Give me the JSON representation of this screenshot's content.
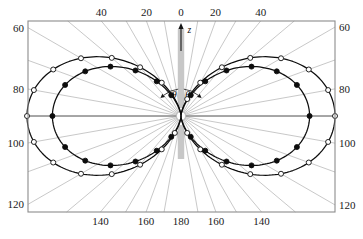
{
  "figure": {
    "kind": "polar-angular-distribution",
    "frame": {
      "left": 28,
      "top": 21,
      "right": 335,
      "bottom": 212
    },
    "center": {
      "x": 181,
      "y": 116
    },
    "axis_marker_label": "z",
    "angle_symbol": "θ",
    "frame_color": "#8c8c8c",
    "grid_color": "#9a9a9a",
    "curve_color": "#0d0d0d",
    "holder_color": "#bdbdbd"
  },
  "axes": {
    "top_labels": [
      {
        "text": "40",
        "angle_deg": -40
      },
      {
        "text": "20",
        "angle_deg": -20
      },
      {
        "text": "0",
        "angle_deg": 0
      },
      {
        "text": "20",
        "angle_deg": 20
      },
      {
        "text": "40",
        "angle_deg": 40
      }
    ],
    "bottom_labels": [
      {
        "text": "140",
        "angle_deg": -140
      },
      {
        "text": "160",
        "angle_deg": -160
      },
      {
        "text": "180",
        "angle_deg": 180
      },
      {
        "text": "160",
        "angle_deg": 160
      },
      {
        "text": "140",
        "angle_deg": 140
      }
    ],
    "left_labels": [
      {
        "text": "60",
        "angle_deg": -60
      },
      {
        "text": "80",
        "angle_deg": -80
      },
      {
        "text": "100",
        "angle_deg": -100
      },
      {
        "text": "120",
        "angle_deg": -120
      }
    ],
    "right_labels": [
      {
        "text": "60",
        "angle_deg": 60
      },
      {
        "text": "80",
        "angle_deg": 80
      },
      {
        "text": "100",
        "angle_deg": 100
      },
      {
        "text": "120",
        "angle_deg": 120
      }
    ],
    "radial_grid_step_deg": 10
  },
  "chart_data": {
    "type": "line",
    "title": "",
    "xlabel": "",
    "ylabel": "",
    "coordinate_system": "polar",
    "angle_unit": "degrees",
    "angle_reference": "z-axis (0° up, 180° down)",
    "radius_normalized_max": 1.0,
    "grid": true,
    "legend": "none",
    "series": [
      {
        "name": "outer",
        "marker": "open-circle",
        "marker_fill": "#ffffff",
        "marker_stroke": "#0d0d0d",
        "amplitude": 1.0,
        "model": "sin^2(theta)",
        "angles_deg": [
          20,
          30,
          40,
          50,
          60,
          70,
          80,
          90,
          100,
          110,
          120,
          130,
          140,
          150,
          160,
          200,
          210,
          220,
          230,
          240,
          250,
          260,
          270,
          280,
          290,
          300,
          310,
          320,
          330
        ],
        "radii": [
          0.117,
          0.25,
          0.413,
          0.587,
          0.75,
          0.883,
          0.97,
          1.0,
          0.97,
          0.883,
          0.75,
          0.587,
          0.413,
          0.25,
          0.117,
          0.117,
          0.25,
          0.413,
          0.587,
          0.75,
          0.883,
          0.97,
          1.0,
          0.97,
          0.883,
          0.75,
          0.587,
          0.413,
          0.25,
          0.117
        ]
      },
      {
        "name": "inner",
        "marker": "filled-circle",
        "marker_fill": "#0d0d0d",
        "marker_stroke": "#0d0d0d",
        "amplitude": 0.835,
        "model": "sin^2(theta)",
        "angles_deg": [
          25,
          35,
          45,
          55,
          65,
          75,
          90,
          105,
          115,
          125,
          135,
          145,
          155,
          205,
          215,
          225,
          235,
          245,
          255,
          270,
          285,
          295,
          305,
          315,
          325,
          335
        ],
        "radii": [
          0.149,
          0.275,
          0.418,
          0.559,
          0.686,
          0.779,
          0.835,
          0.779,
          0.686,
          0.559,
          0.418,
          0.275,
          0.149,
          0.149,
          0.275,
          0.418,
          0.559,
          0.686,
          0.779,
          0.835,
          0.779,
          0.686,
          0.559,
          0.418,
          0.275,
          0.149
        ]
      }
    ],
    "annotations": [
      {
        "text": "θ",
        "meaning": "polar angle left branch"
      },
      {
        "text": "θ",
        "meaning": "polar angle right branch"
      },
      {
        "text": "z",
        "meaning": "axis direction marker"
      }
    ]
  }
}
